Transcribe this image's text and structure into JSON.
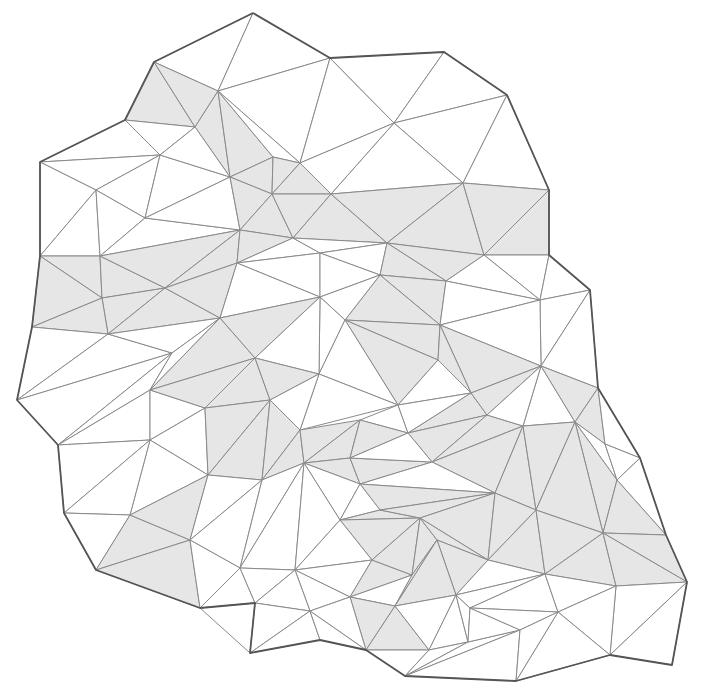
{
  "diagram": {
    "colors": {
      "background": "#ffffff",
      "shaded_fill": "#e6e6e6",
      "plain_fill": "#ffffff",
      "edge": "#8a8a8a",
      "strip_boundary": "#555555"
    },
    "vertices": {
      "A": [
        253,
        13
      ],
      "B": [
        154,
        62
      ],
      "C": [
        330,
        58
      ],
      "D": [
        444,
        52
      ],
      "E": [
        218,
        91
      ],
      "F": [
        507,
        95
      ],
      "G": [
        394,
        123
      ],
      "H": [
        125,
        120
      ],
      "I": [
        195,
        127
      ],
      "J": [
        160,
        155
      ],
      "K": [
        40,
        162
      ],
      "L": [
        96,
        190
      ],
      "M": [
        230,
        177
      ],
      "N": [
        273,
        157
      ],
      "O": [
        331,
        194
      ],
      "P": [
        300,
        163
      ],
      "Q": [
        463,
        183
      ],
      "R": [
        549,
        190
      ],
      "S": [
        145,
        218
      ],
      "T": [
        272,
        194
      ],
      "U": [
        100,
        256
      ],
      "V": [
        293,
        238
      ],
      "W": [
        240,
        230
      ],
      "X": [
        40,
        256
      ],
      "Y": [
        387,
        243
      ],
      "Z": [
        484,
        255
      ],
      "a": [
        549,
        255
      ],
      "b": [
        380,
        275
      ],
      "c": [
        446,
        281
      ],
      "d": [
        102,
        298
      ],
      "e": [
        165,
        288
      ],
      "f": [
        237,
        263
      ],
      "g": [
        32,
        327
      ],
      "h": [
        108,
        334
      ],
      "i": [
        220,
        318
      ],
      "j": [
        320,
        253
      ],
      "k": [
        270,
        400
      ],
      "l": [
        172,
        353
      ],
      "m": [
        320,
        297
      ],
      "n": [
        345,
        320
      ],
      "o": [
        540,
        300
      ],
      "p": [
        590,
        290
      ],
      "q": [
        440,
        325
      ],
      "r": [
        438,
        360
      ],
      "s": [
        17,
        400
      ],
      "t": [
        58,
        445
      ],
      "u": [
        150,
        390
      ],
      "v": [
        205,
        408
      ],
      "w": [
        255,
        358
      ],
      "x": [
        398,
        405
      ],
      "y": [
        471,
        393
      ],
      "z": [
        319,
        374
      ],
      "AA": [
        360,
        420
      ],
      "AB": [
        262,
        480
      ],
      "AC": [
        304,
        463
      ],
      "AD": [
        208,
        475
      ],
      "AE": [
        130,
        515
      ],
      "AF": [
        64,
        513
      ],
      "AG": [
        96,
        570
      ],
      "AH": [
        200,
        608
      ],
      "AI": [
        250,
        653
      ],
      "AJ": [
        190,
        540
      ],
      "AK": [
        255,
        568
      ],
      "AL": [
        310,
        611
      ],
      "AM": [
        350,
        597
      ],
      "AN": [
        372,
        560
      ],
      "AO": [
        412,
        575
      ],
      "AP": [
        360,
        484
      ],
      "AQ": [
        408,
        433
      ],
      "AR": [
        432,
        462
      ],
      "AS": [
        487,
        415
      ],
      "AT": [
        523,
        426
      ],
      "AU": [
        495,
        493
      ],
      "AV": [
        536,
        510
      ],
      "AW": [
        575,
        422
      ],
      "AX": [
        605,
        444
      ],
      "AY": [
        640,
        458
      ],
      "AZ": [
        603,
        533
      ],
      "BA": [
        598,
        388
      ],
      "BB": [
        541,
        366
      ],
      "BC": [
        666,
        535
      ],
      "BD": [
        617,
        480
      ],
      "BE": [
        687,
        582
      ],
      "BF": [
        672,
        665
      ],
      "BG": [
        616,
        586
      ],
      "BH": [
        545,
        574
      ],
      "BI": [
        488,
        560
      ],
      "BJ": [
        437,
        540
      ],
      "BK": [
        470,
        608
      ],
      "BL": [
        520,
        630
      ],
      "BM": [
        429,
        650
      ],
      "BN": [
        366,
        650
      ],
      "BO": [
        395,
        606
      ],
      "BP": [
        405,
        676
      ],
      "BQ": [
        516,
        681
      ],
      "BR": [
        610,
        655
      ],
      "BS": [
        558,
        612
      ],
      "BT": [
        456,
        595
      ],
      "BU": [
        468,
        642
      ],
      "BV": [
        420,
        518
      ],
      "BW": [
        380,
        510
      ],
      "BX": [
        340,
        520
      ],
      "BY": [
        320,
        640
      ],
      "BZ": [
        295,
        570
      ],
      "CA": [
        255,
        603
      ],
      "CB": [
        240,
        568
      ],
      "CC": [
        150,
        440
      ],
      "CD": [
        300,
        430
      ],
      "CE": [
        350,
        458
      ]
    },
    "triangles": [
      [
        "A",
        "B",
        "E",
        0
      ],
      [
        "A",
        "E",
        "C",
        0
      ],
      [
        "A",
        "C",
        "C",
        0
      ],
      [
        "C",
        "E",
        "P",
        0
      ],
      [
        "C",
        "P",
        "G",
        0
      ],
      [
        "C",
        "G",
        "D",
        0
      ],
      [
        "D",
        "G",
        "F",
        0
      ],
      [
        "G",
        "F",
        "Q",
        0
      ],
      [
        "F",
        "R",
        "Q",
        0
      ],
      [
        "G",
        "Q",
        "O",
        0
      ],
      [
        "G",
        "O",
        "P",
        0
      ],
      [
        "B",
        "H",
        "I",
        1
      ],
      [
        "B",
        "I",
        "E",
        1
      ],
      [
        "E",
        "I",
        "M",
        1
      ],
      [
        "E",
        "M",
        "N",
        1
      ],
      [
        "E",
        "N",
        "P",
        0
      ],
      [
        "H",
        "K",
        "J",
        0
      ],
      [
        "H",
        "J",
        "I",
        0
      ],
      [
        "K",
        "L",
        "J",
        0
      ],
      [
        "J",
        "L",
        "S",
        0
      ],
      [
        "J",
        "S",
        "M",
        0
      ],
      [
        "J",
        "M",
        "I",
        0
      ],
      [
        "K",
        "X",
        "L",
        0
      ],
      [
        "L",
        "X",
        "U",
        0
      ],
      [
        "L",
        "U",
        "S",
        0
      ],
      [
        "S",
        "U",
        "W",
        0
      ],
      [
        "S",
        "W",
        "M",
        0
      ],
      [
        "M",
        "T",
        "N",
        1
      ],
      [
        "N",
        "T",
        "P",
        1
      ],
      [
        "P",
        "T",
        "O",
        1
      ],
      [
        "M",
        "W",
        "T",
        1
      ],
      [
        "T",
        "W",
        "V",
        1
      ],
      [
        "T",
        "V",
        "O",
        1
      ],
      [
        "O",
        "V",
        "Y",
        1
      ],
      [
        "O",
        "Y",
        "Q",
        1
      ],
      [
        "Q",
        "Y",
        "Z",
        1
      ],
      [
        "Q",
        "Z",
        "R",
        1
      ],
      [
        "R",
        "Z",
        "a",
        1
      ],
      [
        "X",
        "U",
        "d",
        1
      ],
      [
        "X",
        "d",
        "g",
        1
      ],
      [
        "U",
        "e",
        "d",
        1
      ],
      [
        "U",
        "W",
        "e",
        1
      ],
      [
        "W",
        "f",
        "e",
        1
      ],
      [
        "W",
        "V",
        "f",
        1
      ],
      [
        "d",
        "e",
        "h",
        1
      ],
      [
        "d",
        "h",
        "g",
        1
      ],
      [
        "e",
        "i",
        "h",
        1
      ],
      [
        "e",
        "f",
        "i",
        1
      ],
      [
        "V",
        "j",
        "f",
        0
      ],
      [
        "V",
        "Y",
        "j",
        0
      ],
      [
        "j",
        "Y",
        "b",
        0
      ],
      [
        "f",
        "j",
        "m",
        0
      ],
      [
        "f",
        "m",
        "i",
        0
      ],
      [
        "j",
        "b",
        "m",
        0
      ],
      [
        "Y",
        "Z",
        "c",
        1
      ],
      [
        "Y",
        "c",
        "b",
        1
      ],
      [
        "Z",
        "a",
        "o",
        0
      ],
      [
        "Z",
        "o",
        "c",
        0
      ],
      [
        "a",
        "p",
        "o",
        0
      ],
      [
        "b",
        "c",
        "q",
        1
      ],
      [
        "b",
        "q",
        "n",
        1
      ],
      [
        "b",
        "n",
        "m",
        0
      ],
      [
        "c",
        "o",
        "q",
        0
      ],
      [
        "o",
        "p",
        "BB",
        0
      ],
      [
        "o",
        "BB",
        "q",
        0
      ],
      [
        "g",
        "h",
        "s",
        0
      ],
      [
        "h",
        "l",
        "s",
        0
      ],
      [
        "h",
        "i",
        "l",
        0
      ],
      [
        "s",
        "l",
        "t",
        0
      ],
      [
        "l",
        "u",
        "t",
        0
      ],
      [
        "l",
        "i",
        "u",
        0
      ],
      [
        "i",
        "w",
        "u",
        1
      ],
      [
        "i",
        "m",
        "w",
        1
      ],
      [
        "m",
        "n",
        "z",
        0
      ],
      [
        "m",
        "z",
        "w",
        0
      ],
      [
        "n",
        "q",
        "r",
        1
      ],
      [
        "n",
        "r",
        "x",
        1
      ],
      [
        "n",
        "x",
        "z",
        0
      ],
      [
        "q",
        "BB",
        "y",
        1
      ],
      [
        "q",
        "y",
        "r",
        1
      ],
      [
        "r",
        "y",
        "x",
        0
      ],
      [
        "p",
        "BA",
        "BB",
        0
      ],
      [
        "t",
        "u",
        "CC",
        0
      ],
      [
        "t",
        "CC",
        "AF",
        0
      ],
      [
        "u",
        "v",
        "CC",
        0
      ],
      [
        "u",
        "w",
        "v",
        1
      ],
      [
        "w",
        "k",
        "v",
        1
      ],
      [
        "w",
        "z",
        "k",
        1
      ],
      [
        "z",
        "x",
        "CD",
        0
      ],
      [
        "z",
        "CD",
        "k",
        0
      ],
      [
        "x",
        "AQ",
        "AA",
        0
      ],
      [
        "x",
        "y",
        "AQ",
        0
      ],
      [
        "CC",
        "v",
        "AD",
        0
      ],
      [
        "CC",
        "AD",
        "AE",
        0
      ],
      [
        "CC",
        "AE",
        "AF",
        0
      ],
      [
        "v",
        "k",
        "AD",
        1
      ],
      [
        "k",
        "AB",
        "AD",
        1
      ],
      [
        "k",
        "CD",
        "AB",
        1
      ],
      [
        "CD",
        "AC",
        "AB",
        1
      ],
      [
        "CD",
        "AA",
        "AC",
        1
      ],
      [
        "AA",
        "CE",
        "AC",
        1
      ],
      [
        "AA",
        "AQ",
        "CE",
        1
      ],
      [
        "y",
        "AS",
        "AQ",
        1
      ],
      [
        "y",
        "BB",
        "AS",
        1
      ],
      [
        "AS",
        "AR",
        "AQ",
        1
      ],
      [
        "AS",
        "AT",
        "AR",
        1
      ],
      [
        "BB",
        "AW",
        "AT",
        0
      ],
      [
        "BB",
        "BA",
        "AW",
        1
      ],
      [
        "BB",
        "AT",
        "AS",
        0
      ],
      [
        "BA",
        "AX",
        "AW",
        1
      ],
      [
        "BA",
        "AY",
        "AX",
        0
      ],
      [
        "AX",
        "BD",
        "AW",
        0
      ],
      [
        "AY",
        "BD",
        "AX",
        0
      ],
      [
        "AY",
        "BC",
        "BD",
        0
      ],
      [
        "AF",
        "AE",
        "AG",
        0
      ],
      [
        "AE",
        "AJ",
        "AG",
        1
      ],
      [
        "AE",
        "AD",
        "AJ",
        1
      ],
      [
        "AD",
        "AB",
        "AJ",
        0
      ],
      [
        "AB",
        "CB",
        "AJ",
        0
      ],
      [
        "AB",
        "AC",
        "CB",
        0
      ],
      [
        "AG",
        "AJ",
        "AH",
        1
      ],
      [
        "AJ",
        "CB",
        "AH",
        0
      ],
      [
        "AH",
        "CB",
        "CA",
        0
      ],
      [
        "AH",
        "CA",
        "AI",
        0
      ],
      [
        "CB",
        "AC",
        "BZ",
        0
      ],
      [
        "CB",
        "BZ",
        "CA",
        0
      ],
      [
        "AC",
        "CE",
        "AP",
        1
      ],
      [
        "AC",
        "AP",
        "BX",
        0
      ],
      [
        "AC",
        "BX",
        "BZ",
        0
      ],
      [
        "CE",
        "AR",
        "AP",
        1
      ],
      [
        "AQ",
        "AR",
        "CE",
        0
      ],
      [
        "AR",
        "AT",
        "AU",
        1
      ],
      [
        "AR",
        "AU",
        "AP",
        0
      ],
      [
        "AP",
        "AU",
        "BW",
        1
      ],
      [
        "AP",
        "BW",
        "BX",
        0
      ],
      [
        "AT",
        "AV",
        "AU",
        1
      ],
      [
        "AT",
        "AW",
        "AV",
        1
      ],
      [
        "AW",
        "BD",
        "AZ",
        1
      ],
      [
        "AW",
        "AZ",
        "AV",
        1
      ],
      [
        "BD",
        "BC",
        "AZ",
        1
      ],
      [
        "BC",
        "BE",
        "AZ",
        1
      ],
      [
        "BX",
        "BW",
        "BV",
        1
      ],
      [
        "BX",
        "BV",
        "AN",
        1
      ],
      [
        "BX",
        "AN",
        "BZ",
        0
      ],
      [
        "BW",
        "AU",
        "BV",
        1
      ],
      [
        "AU",
        "BI",
        "BV",
        1
      ],
      [
        "AU",
        "AV",
        "BI",
        1
      ],
      [
        "AV",
        "BH",
        "BI",
        1
      ],
      [
        "AV",
        "AZ",
        "BH",
        1
      ],
      [
        "AZ",
        "BG",
        "BH",
        1
      ],
      [
        "AZ",
        "BE",
        "BG",
        1
      ],
      [
        "BZ",
        "AN",
        "AM",
        0
      ],
      [
        "BZ",
        "AM",
        "AL",
        0
      ],
      [
        "BZ",
        "AL",
        "CA",
        0
      ],
      [
        "CA",
        "AL",
        "AI",
        0
      ],
      [
        "AL",
        "BY",
        "AI",
        0
      ],
      [
        "AN",
        "AO",
        "AM",
        1
      ],
      [
        "AN",
        "BV",
        "AO",
        1
      ],
      [
        "BV",
        "BJ",
        "AO",
        1
      ],
      [
        "BV",
        "BI",
        "BJ",
        1
      ],
      [
        "BI",
        "BT",
        "BJ",
        1
      ],
      [
        "BI",
        "BH",
        "BT",
        0
      ],
      [
        "AM",
        "AO",
        "BO",
        0
      ],
      [
        "AM",
        "BO",
        "BN",
        1
      ],
      [
        "AM",
        "BN",
        "AL",
        0
      ],
      [
        "AL",
        "BN",
        "BY",
        0
      ],
      [
        "BO",
        "BM",
        "BN",
        1
      ],
      [
        "BN",
        "BM",
        "BP",
        0
      ],
      [
        "AO",
        "BJ",
        "BO",
        1
      ],
      [
        "BJ",
        "BT",
        "BO",
        1
      ],
      [
        "BO",
        "BT",
        "BM",
        0
      ],
      [
        "BT",
        "BU",
        "BM",
        0
      ],
      [
        "BT",
        "BK",
        "BU",
        0
      ],
      [
        "BT",
        "BH",
        "BK",
        0
      ],
      [
        "BM",
        "BU",
        "BP",
        0
      ],
      [
        "BU",
        "BL",
        "BP",
        0
      ],
      [
        "BL",
        "BQ",
        "BP",
        0
      ],
      [
        "BK",
        "BL",
        "BU",
        0
      ],
      [
        "BH",
        "BS",
        "BK",
        0
      ],
      [
        "BK",
        "BS",
        "BL",
        0
      ],
      [
        "BH",
        "BG",
        "BS",
        0
      ],
      [
        "BG",
        "BE",
        "BR",
        0
      ],
      [
        "BG",
        "BR",
        "BS",
        0
      ],
      [
        "BS",
        "BR",
        "BQ",
        0
      ],
      [
        "BS",
        "BQ",
        "BL",
        0
      ],
      [
        "BR",
        "BE",
        "BF",
        0
      ]
    ],
    "outline": [
      "A",
      "C",
      "D",
      "F",
      "R",
      "a",
      "p",
      "BA",
      "AY",
      "BC",
      "BE",
      "BF",
      "BR",
      "BQ",
      "BP",
      "BN",
      "BY",
      "AI",
      "CA",
      "AH",
      "AG",
      "AF",
      "t",
      "s",
      "g",
      "X",
      "K",
      "H",
      "B",
      "A"
    ]
  }
}
